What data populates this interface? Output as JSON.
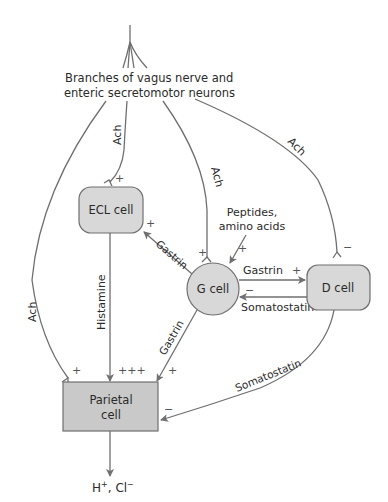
{
  "diagram": {
    "source_label": {
      "line1": "Branches of vagus nerve and",
      "line2": "enteric secretomotor neurons"
    },
    "nodes": {
      "ecl": "ECL cell",
      "g": "G cell",
      "d": "D cell",
      "parietal_line1": "Parietal",
      "parietal_line2": "cell"
    },
    "inputs": {
      "peptides_line1": "Peptides,",
      "peptides_line2": "amino acids"
    },
    "output": {
      "h": "H",
      "h_sup": "+",
      "sep": ", ",
      "cl": "Cl",
      "cl_sup": "−"
    },
    "edge_labels": {
      "ach_parietal": "Ach",
      "ach_ecl": "Ach",
      "ach_g": "Ach",
      "ach_d": "Ach",
      "gastrin_ecl": "Gastrin",
      "gastrin_d": "Gastrin",
      "gastrin_parietal": "Gastrin",
      "histamine": "Histamine",
      "somatostatin_g": "Somatostatin",
      "somatostatin_parietal": "Somatostatin"
    },
    "signs": {
      "ecl_ach": "+",
      "ecl_gastrin": "+",
      "g_ach": "+",
      "g_peptides": "+",
      "d_gastrin": "+",
      "g_somatostatin": "−",
      "d_ach": "−",
      "parietal_ach": "+",
      "parietal_histamine": "+++",
      "parietal_gastrin": "+",
      "parietal_somatostatin": "−"
    },
    "colors": {
      "line": "#6f6f6f",
      "cell_fill": "#d8d8d8",
      "parietal_fill": "#c9c9c9",
      "text": "#2a2a2a"
    }
  }
}
